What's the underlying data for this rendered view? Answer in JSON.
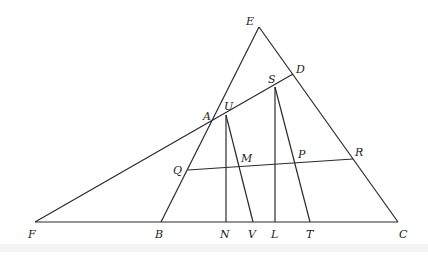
{
  "diagram": {
    "type": "geometric-figure",
    "points": {
      "E": {
        "x": 259,
        "y": 27,
        "label": "E",
        "lx": 246,
        "ly": 25
      },
      "D": {
        "x": 293,
        "y": 74,
        "label": "D",
        "lx": 296,
        "ly": 73
      },
      "S": {
        "x": 275,
        "y": 87,
        "label": "S",
        "lx": 268,
        "ly": 83
      },
      "U": {
        "x": 226,
        "y": 115,
        "label": "U",
        "lx": 224,
        "ly": 110
      },
      "A": {
        "x": 212,
        "y": 120,
        "label": "A",
        "lx": 203,
        "ly": 120
      },
      "Q": {
        "x": 188,
        "y": 170,
        "label": "Q",
        "lx": 173,
        "ly": 174
      },
      "M": {
        "x": 240,
        "y": 166,
        "label": "M",
        "lx": 241,
        "ly": 162
      },
      "P": {
        "x": 296,
        "y": 162,
        "label": "P",
        "lx": 298,
        "ly": 158
      },
      "R": {
        "x": 353,
        "y": 159,
        "label": "R",
        "lx": 355,
        "ly": 156
      },
      "F": {
        "x": 35,
        "y": 222,
        "label": "F",
        "lx": 28,
        "ly": 238
      },
      "B": {
        "x": 161,
        "y": 222,
        "label": "B",
        "lx": 155,
        "ly": 238
      },
      "N": {
        "x": 226,
        "y": 222,
        "label": "N",
        "lx": 220,
        "ly": 238
      },
      "V": {
        "x": 253,
        "y": 222,
        "label": "V",
        "lx": 248,
        "ly": 238
      },
      "L": {
        "x": 275,
        "y": 222,
        "label": "L",
        "lx": 271,
        "ly": 238
      },
      "T": {
        "x": 310,
        "y": 222,
        "label": "T",
        "lx": 306,
        "ly": 238
      },
      "C": {
        "x": 398,
        "y": 222,
        "label": "C",
        "lx": 399,
        "ly": 238
      }
    },
    "segments": [
      [
        "E",
        "B"
      ],
      [
        "E",
        "C"
      ],
      [
        "F",
        "C"
      ],
      [
        "F",
        "D"
      ],
      [
        "U",
        "N"
      ],
      [
        "U",
        "V"
      ],
      [
        "S",
        "L"
      ],
      [
        "S",
        "T"
      ],
      [
        "Q",
        "R"
      ]
    ]
  }
}
